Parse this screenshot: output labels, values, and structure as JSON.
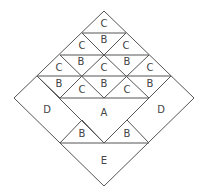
{
  "diagram": {
    "line_color": "#555555",
    "text_color": "#444444",
    "background": "#ffffff",
    "labels": {
      "top_c": "C",
      "r2": [
        "C",
        "B",
        "C"
      ],
      "r3": [
        "C",
        "B",
        "C",
        "B",
        "C"
      ],
      "r4": [
        "B",
        "C",
        "B",
        "C",
        "B"
      ],
      "center": "A",
      "left_d": "D",
      "right_d": "D",
      "bottom_b": [
        "B",
        "B"
      ],
      "bottom": "E"
    }
  }
}
